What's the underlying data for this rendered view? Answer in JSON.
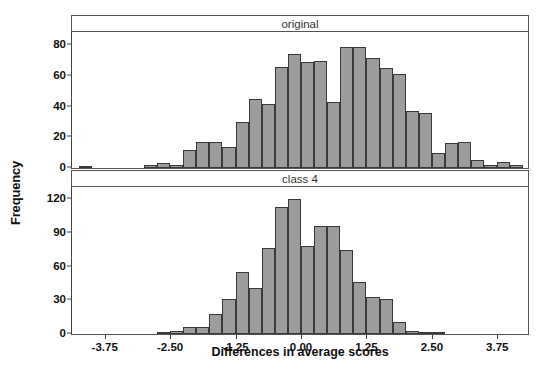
{
  "figure": {
    "ylabel": "Frequency",
    "xlabel": "Differences in average scores"
  },
  "chart_data": {
    "type": "bar",
    "title": "",
    "xlabel": "Differences in average scores",
    "ylabel": "Frequency",
    "grid": false,
    "legend": "none",
    "binwidth": 0.25,
    "xlim": [
      -4.375,
      4.375
    ],
    "xticks": [
      "-3.75",
      "-2.50",
      "-1.25",
      "0.00",
      "1.25",
      "2.50",
      "3.75"
    ],
    "xtick_values": [
      -3.75,
      -2.5,
      -1.25,
      0,
      1.25,
      2.5,
      3.75
    ],
    "panels": [
      {
        "label": "original",
        "ylim": [
          0,
          88
        ],
        "yticks": [
          "0",
          "20",
          "40",
          "60",
          "80"
        ],
        "ytick_values": [
          0,
          20,
          40,
          60,
          80
        ],
        "bin_centers": [
          -4.125,
          -3.875,
          -3.625,
          -3.375,
          -3.125,
          -2.875,
          -2.625,
          -2.375,
          -2.125,
          -1.875,
          -1.625,
          -1.375,
          -1.125,
          -0.875,
          -0.625,
          -0.375,
          -0.125,
          0.125,
          0.375,
          0.625,
          0.875,
          1.125,
          1.375,
          1.625,
          1.875,
          2.125,
          2.375,
          2.625,
          2.875,
          3.125,
          3.375,
          3.625,
          3.875,
          4.125
        ],
        "values": [
          1,
          0,
          0,
          0,
          0,
          2,
          3,
          2,
          12,
          17,
          17,
          14,
          30,
          45,
          42,
          66,
          74,
          69,
          70,
          43,
          79,
          79,
          72,
          65,
          61,
          37,
          36,
          10,
          16,
          17,
          5,
          2,
          4,
          2
        ]
      },
      {
        "label": "class 4",
        "ylim": [
          0,
          130
        ],
        "yticks": [
          "0",
          "30",
          "60",
          "90",
          "120"
        ],
        "ytick_values": [
          0,
          30,
          60,
          90,
          120
        ],
        "bin_centers": [
          -4.125,
          -3.875,
          -3.625,
          -3.375,
          -3.125,
          -2.875,
          -2.625,
          -2.375,
          -2.125,
          -1.875,
          -1.625,
          -1.375,
          -1.125,
          -0.875,
          -0.625,
          -0.375,
          -0.125,
          0.125,
          0.375,
          0.625,
          0.875,
          1.125,
          1.375,
          1.625,
          1.875,
          2.125,
          2.375,
          2.625,
          2.875,
          3.125,
          3.375,
          3.625,
          3.875,
          4.125
        ],
        "values": [
          0,
          0,
          0,
          0,
          0,
          0,
          2,
          3,
          6,
          6,
          18,
          31,
          55,
          41,
          77,
          113,
          120,
          78,
          96,
          96,
          75,
          46,
          33,
          31,
          11,
          3,
          2,
          1,
          0,
          0,
          0,
          0,
          0,
          0
        ]
      }
    ]
  }
}
